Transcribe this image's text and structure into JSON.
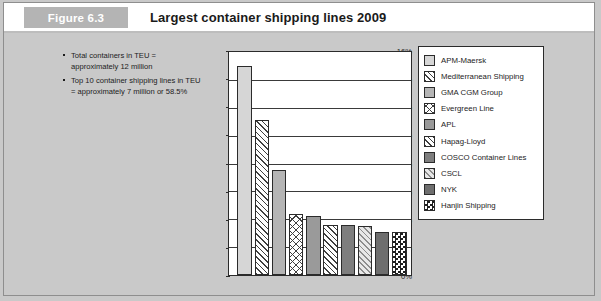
{
  "header": {
    "figure_tag": "Figure 6.3",
    "title": "Largest container shipping lines 2009"
  },
  "notes": {
    "bullets": [
      "Total containers in TEU = approximately 12 million",
      "Top 10 container shipping lines in TEU = approximately 7 million or 58.5%"
    ]
  },
  "colors": {
    "page_background": "#c9c9c9",
    "header_background": "#ffffff",
    "figure_tag_background": "#b4b4b4",
    "figure_tag_text": "#ffffff",
    "plot_background": "#ffffff",
    "axis": "#2b2b2b",
    "gridline": "#3a3a3a",
    "text": "#1c1c1c"
  },
  "chart_data": {
    "type": "bar",
    "title": "Largest container shipping lines 2009",
    "xlabel": "",
    "ylabel": "",
    "ylim": [
      0,
      16
    ],
    "yunit": "%",
    "grid": true,
    "legend_position": "right",
    "ytick_labels": [
      "16%",
      "14%",
      "12%",
      "10%",
      "8%",
      "6%",
      "4%",
      "2%",
      "0%"
    ],
    "ytick_values": [
      16,
      14,
      12,
      10,
      8,
      6,
      4,
      2,
      0
    ],
    "categories": [
      "APM-Maersk",
      "Mediterranean Shipping",
      "GMA CGM Group",
      "Evergreen Line",
      "APL",
      "Hapag-Lloyd",
      "COSCO Container Lines",
      "CSCL",
      "NYK",
      "Hanjin Shipping"
    ],
    "values": [
      15.0,
      11.1,
      7.5,
      4.4,
      4.2,
      3.6,
      3.6,
      3.5,
      3.1,
      3.1
    ],
    "fills": [
      "solid-light",
      "diagonal-hatch",
      "solid-mid",
      "crosshatch",
      "solid-midgrey",
      "diagonal-hatch",
      "solid-dark",
      "diagonal-hatch-light",
      "solid-darker",
      "checkerboard"
    ]
  },
  "legend": {
    "items": [
      {
        "label": "APM-Maersk"
      },
      {
        "label": "Mediterranean Shipping"
      },
      {
        "label": "GMA CGM Group"
      },
      {
        "label": "Evergreen Line"
      },
      {
        "label": "APL"
      },
      {
        "label": "Hapag-Lloyd"
      },
      {
        "label": "COSCO Container Lines"
      },
      {
        "label": "CSCL"
      },
      {
        "label": "NYK"
      },
      {
        "label": "Hanjin Shipping"
      }
    ]
  }
}
